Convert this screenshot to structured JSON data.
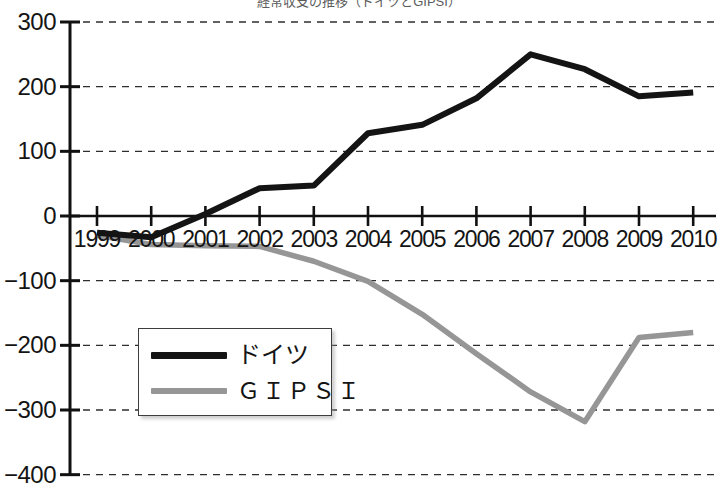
{
  "chart_data": {
    "type": "line",
    "title": "経常収支の推移（ドイツとGIPSI）",
    "xlabel": "",
    "ylabel": "",
    "x": [
      1999,
      2000,
      2001,
      2002,
      2003,
      2004,
      2005,
      2006,
      2007,
      2008,
      2009,
      2010
    ],
    "categories": [
      "1999",
      "2000",
      "2001",
      "2002",
      "2003",
      "2004",
      "2005",
      "2006",
      "2007",
      "2008",
      "2009",
      "2010"
    ],
    "ylim": [
      -400,
      300
    ],
    "yticks": [
      300,
      200,
      100,
      0,
      -100,
      -200,
      -300,
      -400
    ],
    "ytick_labels": [
      "300",
      "200",
      "100",
      "0",
      "−100",
      "−200",
      "−300",
      "−400"
    ],
    "grid": true,
    "grid_style": "dashed-horizontal",
    "legend_position": "lower-left-inside",
    "series": [
      {
        "name": "ドイツ",
        "color": "#141414",
        "values": [
          -26,
          -33,
          3,
          43,
          47,
          128,
          141,
          182,
          250,
          227,
          185,
          191
        ]
      },
      {
        "name": "ＧＩＰＳＩ",
        "color": "#969696",
        "values": [
          -30,
          -44,
          -46,
          -47,
          -70,
          -101,
          -152,
          -213,
          -272,
          -318,
          -188,
          -180
        ]
      }
    ]
  },
  "axis": {
    "y_axis_name": "y-axis",
    "x_axis_name": "x-axis"
  },
  "legend": {
    "entries": [
      {
        "label": "ドイツ",
        "color": "#141414"
      },
      {
        "label": "ＧＩＰＳＩ",
        "color": "#969696"
      }
    ]
  }
}
